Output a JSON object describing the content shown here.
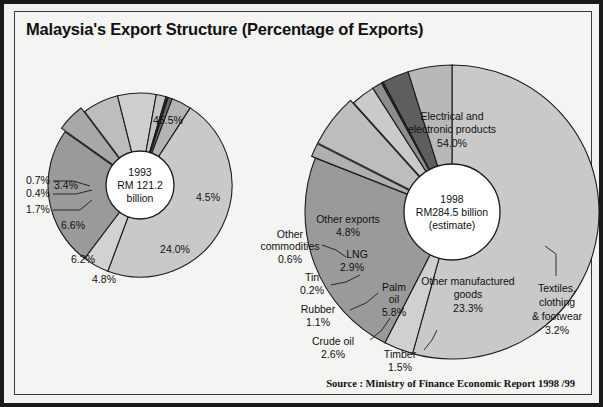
{
  "title": "Malaysia's Export Structure (Percentage of Exports)",
  "source": "Source : Ministry of Finance Economic Report 1998 /99",
  "colors": {
    "background": "#f4f4f2",
    "border": "#1a1a1a",
    "text": "#111111",
    "light_gray": "#c9c9c9",
    "mid_gray": "#a8a8a8",
    "dark_gray": "#7e7e7e",
    "darkest": "#2e2e2e"
  },
  "chart_data": [
    {
      "type": "pie",
      "name": "1993",
      "title": "1993",
      "center_label": [
        "1993",
        "RM  121.2",
        "billion"
      ],
      "total_label": "RM 121.2 billion",
      "units": "percent of exports",
      "cx": 140,
      "cy": 185,
      "r": 92,
      "hub_r": 34,
      "start_angle": -57,
      "categories": [
        "Electrical and electronic products",
        "Other commodities",
        "Other manufactured goods",
        "Timber",
        "Palm oil",
        "Crude oil",
        "Rubber",
        "Tin",
        "LNG",
        "Other exports"
      ],
      "values": [
        45.5,
        4.5,
        24.0,
        4.8,
        6.2,
        6.6,
        1.7,
        0.4,
        0.7,
        3.4
      ],
      "labels": [
        "45.5%",
        "4.5%",
        "24.0%",
        "4.8%",
        "6.2%",
        "6.6%",
        "1.7%",
        "0.4%",
        "0.7%",
        "3.4%"
      ],
      "fills": [
        "#c9c9c9",
        "#d2d2d2",
        "#9a9a9a",
        "#a8a8a8",
        "#bdbdbd",
        "#cfcfcf",
        "#c4c4c4",
        "#2e2e2e",
        "#6d6d6d",
        "#b4b4b4"
      ],
      "inside_labels": [
        {
          "text": "45.5%",
          "x": 168,
          "y": 124
        },
        {
          "text": "4.5%",
          "x": 208,
          "y": 201
        },
        {
          "text": "24.0%",
          "x": 175,
          "y": 253
        },
        {
          "text": "4.8%",
          "x": 104,
          "y": 283
        },
        {
          "text": "6.2%",
          "x": 83,
          "y": 263
        },
        {
          "text": "6.6%",
          "x": 73,
          "y": 229
        },
        {
          "text": "3.4%",
          "x": 66,
          "y": 189
        }
      ],
      "callouts": [
        {
          "text": "0.7%",
          "x": 26,
          "y": 184,
          "anchor": "start",
          "line": [
            [
              53,
              181
            ],
            [
              73,
              181
            ],
            [
              90,
              186
            ]
          ]
        },
        {
          "text": "0.4%",
          "x": 26,
          "y": 197,
          "anchor": "start",
          "line": [
            [
              53,
              194
            ],
            [
              76,
              194
            ],
            [
              92,
              190
            ]
          ]
        },
        {
          "text": "1.7%",
          "x": 26,
          "y": 213,
          "anchor": "start",
          "line": [
            [
              53,
              210
            ],
            [
              80,
              210
            ],
            [
              92,
              200
            ]
          ]
        }
      ]
    },
    {
      "type": "pie",
      "name": "1998",
      "title": "1998",
      "center_label": [
        "1998",
        "RM284.5  billion",
        "(estimate)"
      ],
      "total_label": "RM284.5 billion (estimate)",
      "units": "percent of exports",
      "cx": 452,
      "cy": 212,
      "r": 147,
      "hub_r": 48,
      "start_angle": -90,
      "categories": [
        "Electrical and electronic products",
        "Textiles, clothing & footwear",
        "Other manufactured goods",
        "Timber",
        "Palm oil",
        "Crude oil",
        "Rubber",
        "Tin",
        "LNG",
        "Other exports"
      ],
      "values": [
        54.0,
        3.2,
        23.3,
        1.5,
        5.8,
        2.6,
        1.1,
        0.2,
        2.9,
        4.8
      ],
      "labels": [
        "54.0%",
        "3.2%",
        "23.3%",
        "1.5%",
        "5.8%",
        "2.6%",
        "1.1%",
        "0.2%",
        "2.9%",
        "4.8%"
      ],
      "fills": [
        "#c9c9c9",
        "#d0d0d0",
        "#9a9a9a",
        "#b0b0b0",
        "#bdbdbd",
        "#cacaca",
        "#8d8d8d",
        "#2e2e2e",
        "#5e5e5e",
        "#b8b8b8"
      ],
      "inside_labels": [
        {
          "text": "Electrical and",
          "x": 452,
          "y": 120
        },
        {
          "text": "electronic products",
          "x": 452,
          "y": 133
        },
        {
          "text": "54.0%",
          "x": 452,
          "y": 147
        },
        {
          "text": "Other manufactured",
          "x": 468,
          "y": 285
        },
        {
          "text": "goods",
          "x": 468,
          "y": 298
        },
        {
          "text": "23.3%",
          "x": 468,
          "y": 312
        },
        {
          "text": "Other exports",
          "x": 348,
          "y": 223
        },
        {
          "text": "4.8%",
          "x": 348,
          "y": 236
        },
        {
          "text": "LNG",
          "x": 357,
          "y": 258
        },
        {
          "text": "2.9%",
          "x": 352,
          "y": 271
        },
        {
          "text": "Palm",
          "x": 394,
          "y": 291
        },
        {
          "text": "oil",
          "x": 394,
          "y": 303
        },
        {
          "text": "5.8%",
          "x": 394,
          "y": 316
        }
      ],
      "callouts": [
        {
          "text": "Other",
          "x": 290,
          "y": 238,
          "anchor": "middle",
          "line": [
            [
              322,
              245
            ],
            [
              336,
              250
            ],
            [
              346,
              257
            ]
          ]
        },
        {
          "text": "commodities",
          "x": 290,
          "y": 250,
          "anchor": "middle",
          "line": []
        },
        {
          "text": "0.6%",
          "x": 290,
          "y": 263,
          "anchor": "middle",
          "line": []
        },
        {
          "text": "Tin",
          "x": 312,
          "y": 281,
          "anchor": "middle",
          "line": [
            [
              331,
              285
            ],
            [
              346,
              282
            ],
            [
              360,
              275
            ]
          ]
        },
        {
          "text": "0.2%",
          "x": 312,
          "y": 294,
          "anchor": "middle",
          "line": []
        },
        {
          "text": "Rubber",
          "x": 318,
          "y": 313,
          "anchor": "middle",
          "line": [
            [
              350,
              310
            ],
            [
              366,
              303
            ],
            [
              378,
              293
            ]
          ]
        },
        {
          "text": "1.1%",
          "x": 318,
          "y": 326,
          "anchor": "middle",
          "line": []
        },
        {
          "text": "Crude  oil",
          "x": 333,
          "y": 345,
          "anchor": "middle",
          "line": [
            [
              370,
              340
            ],
            [
              382,
              330
            ],
            [
              390,
              318
            ]
          ]
        },
        {
          "text": "2.6%",
          "x": 333,
          "y": 358,
          "anchor": "middle",
          "line": []
        },
        {
          "text": "Timber",
          "x": 400,
          "y": 358,
          "anchor": "middle",
          "line": [
            [
              424,
              350
            ],
            [
              432,
              340
            ],
            [
              437,
              330
            ]
          ]
        },
        {
          "text": "1.5%",
          "x": 400,
          "y": 371,
          "anchor": "middle",
          "line": []
        },
        {
          "text": "Textiles,",
          "x": 557,
          "y": 292,
          "anchor": "middle",
          "line": [
            [
              556,
              276
            ],
            [
              556,
              254
            ],
            [
              545,
              246
            ]
          ]
        },
        {
          "text": "clothing",
          "x": 557,
          "y": 306,
          "anchor": "middle",
          "line": []
        },
        {
          "text": "&  footwear",
          "x": 557,
          "y": 320,
          "anchor": "middle",
          "line": []
        },
        {
          "text": "3.2%",
          "x": 557,
          "y": 334,
          "anchor": "middle",
          "line": []
        }
      ]
    }
  ]
}
